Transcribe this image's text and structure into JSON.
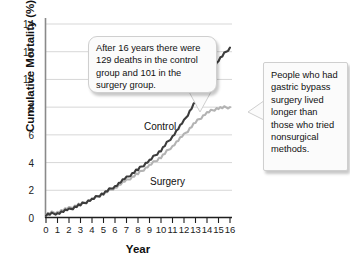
{
  "chart_data": {
    "type": "line",
    "title": "",
    "xlabel": "Year",
    "ylabel": "Cumulative Mortality (%)",
    "xlim": [
      0,
      16
    ],
    "ylim": [
      0,
      14
    ],
    "grid": "horizontal",
    "legend": "inline-labels",
    "xticks": [
      "0",
      "1",
      "2",
      "3",
      "4",
      "5",
      "6",
      "7",
      "8",
      "9",
      "10",
      "11",
      "12",
      "13",
      "14",
      "15",
      "16"
    ],
    "yticks": [
      "0",
      "2",
      "4",
      "6",
      "8",
      "10",
      "12",
      "14"
    ],
    "x": [
      0,
      1,
      2,
      3,
      4,
      5,
      6,
      7,
      8,
      9,
      10,
      11,
      12,
      13,
      14,
      15,
      16
    ],
    "series": [
      {
        "name": "Control",
        "color": "#3c3c3c",
        "label": "Control",
        "values": [
          0.25,
          0.35,
          0.6,
          0.95,
          1.35,
          1.8,
          2.3,
          2.9,
          3.5,
          4.15,
          4.9,
          5.9,
          7.0,
          8.4,
          9.9,
          11.4,
          12.3
        ]
      },
      {
        "name": "Surgery",
        "color": "#b3b3b3",
        "label": "Surgery",
        "values": [
          0.3,
          0.45,
          0.7,
          1.0,
          1.35,
          1.75,
          2.2,
          2.7,
          3.2,
          3.8,
          4.4,
          5.2,
          6.0,
          6.9,
          7.6,
          7.95,
          8.0
        ]
      }
    ],
    "annotations": [
      {
        "id": "callout-deaths",
        "text": "After 16 years there were 129 deaths in the control group and 101 in the surgery group."
      },
      {
        "id": "callout-outcome",
        "text": "People who had gastric bypass surgery lived longer than those who tried nonsurgical methods."
      }
    ]
  }
}
